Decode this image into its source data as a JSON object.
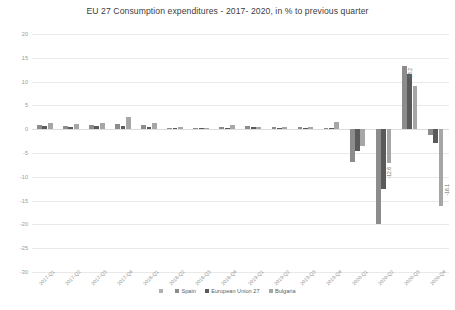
{
  "chart_data": {
    "type": "bar",
    "title": "EU 27 Consumption expenditures - 2017- 2020, in % to previous quarter",
    "xlabel": "",
    "ylabel": "",
    "ylim": [
      -30,
      20
    ],
    "yticks": [
      20,
      15,
      10,
      5,
      0,
      -5,
      -10,
      -15,
      -20,
      -25,
      -30
    ],
    "grid": true,
    "legend_position": "bottom",
    "categories": [
      "2017-Q1",
      "2017-Q2",
      "2017-Q3",
      "2017-Q4",
      "2018-Q1",
      "2018-Q2",
      "2018-Q3",
      "2018-Q4",
      "2019-Q1",
      "2019-Q2",
      "2019-Q3",
      "2019-Q4",
      "2020-Q1",
      "2020-Q2",
      "2020-Q3",
      "2020-Q4"
    ],
    "series": [
      {
        "name": "Spain",
        "color": "#8c8c8c",
        "values": [
          0.9,
          0.6,
          0.9,
          1.0,
          0.8,
          0.3,
          0.2,
          0.4,
          0.6,
          0.5,
          0.4,
          0.3,
          -6.8,
          -20.0,
          13.2,
          -1.2
        ]
      },
      {
        "name": "European Union 27",
        "color": "#5a5a5a",
        "values": [
          0.6,
          0.5,
          0.6,
          0.7,
          0.5,
          0.3,
          0.2,
          0.3,
          0.4,
          0.3,
          0.3,
          0.2,
          -4.5,
          -12.6,
          11.5,
          -3.0
        ]
      },
      {
        "name": "Bulgaria",
        "color": "#a6a6a6",
        "values": [
          1.3,
          1.1,
          1.4,
          2.6,
          1.2,
          0.4,
          0.3,
          0.8,
          0.5,
          0.4,
          0.5,
          1.6,
          -3.5,
          -7.0,
          9.0,
          -16.1
        ]
      }
    ],
    "data_labels": [
      {
        "text": "13.2",
        "category": "2020-Q3",
        "series": "Spain"
      },
      {
        "text": "-12.6",
        "category": "2020-Q2",
        "series": "European Union 27"
      },
      {
        "text": "-16.1",
        "category": "2020-Q4",
        "series": "Bulgaria"
      }
    ],
    "legend_entries": [
      "",
      "Spain",
      "European Union 27",
      "Bulgaria"
    ]
  }
}
